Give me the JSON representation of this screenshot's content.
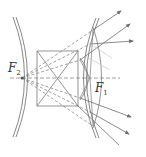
{
  "diagram": {
    "title": "",
    "labels": {
      "f2": {
        "main": "F",
        "sub": "2"
      },
      "f1": {
        "main": "F",
        "sub": "1"
      }
    },
    "colors": {
      "line": "#6e6e6e",
      "dashed": "#7a7a7a",
      "light_ray": "#c8c8c8",
      "text": "#333333"
    }
  }
}
